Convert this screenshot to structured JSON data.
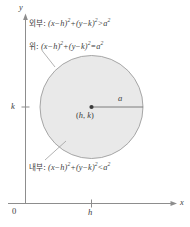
{
  "figure": {
    "background": "#ffffff",
    "circle_fill": "#e9e9e9",
    "circle_stroke": "#9a9a9a",
    "axis_color": "#8d8d8d",
    "text_color": "#3c3c3c"
  },
  "axes": {
    "x_label": "x",
    "y_label": "y",
    "origin_label": "0",
    "x_tick_label": "h",
    "y_tick_label": "k"
  },
  "circle": {
    "center_label_open": "(",
    "center_label_h": "h",
    "center_label_comma": ", ",
    "center_label_k": "k",
    "center_label_close": ")",
    "radius_label": "a"
  },
  "annotations": {
    "exterior": {
      "ko": "외부:",
      "expr_lhs_open": "(",
      "expr_x": "x",
      "expr_minus1": "−",
      "expr_h": "h",
      "expr_close1": ")",
      "expr_sup1": "2",
      "expr_plus": "+",
      "expr_open2": "(",
      "expr_y": "y",
      "expr_minus2": "−",
      "expr_k": "k",
      "expr_close2": ")",
      "expr_sup2": "2",
      "relation": ">",
      "expr_a": "a",
      "expr_sup3": "2"
    },
    "on": {
      "ko": "위:",
      "expr_lhs_open": "(",
      "expr_x": "x",
      "expr_minus1": "−",
      "expr_h": "h",
      "expr_close1": ")",
      "expr_sup1": "2",
      "expr_plus": "+",
      "expr_open2": "(",
      "expr_y": "y",
      "expr_minus2": "−",
      "expr_k": "k",
      "expr_close2": ")",
      "expr_sup2": "2",
      "relation": "=",
      "expr_a": "a",
      "expr_sup3": "2"
    },
    "interior": {
      "ko": "내부:",
      "expr_lhs_open": "(",
      "expr_x": "x",
      "expr_minus1": "−",
      "expr_h": "h",
      "expr_close1": ")",
      "expr_sup1": "2",
      "expr_plus": "+",
      "expr_open2": "(",
      "expr_y": "y",
      "expr_minus2": "−",
      "expr_k": "k",
      "expr_close2": ")",
      "expr_sup2": "2",
      "relation": "<",
      "expr_a": "a",
      "expr_sup3": "2"
    }
  }
}
